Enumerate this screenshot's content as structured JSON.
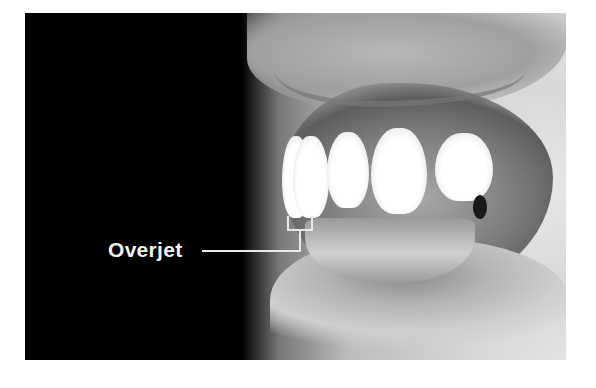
{
  "figure": {
    "annotation": {
      "label": "Overjet",
      "pointer": "bracket spanning horizontal gap between upper and lower front incisors"
    },
    "colors": {
      "background": "#000000",
      "annotation": "#eeeeee",
      "page": "#ffffff"
    }
  }
}
